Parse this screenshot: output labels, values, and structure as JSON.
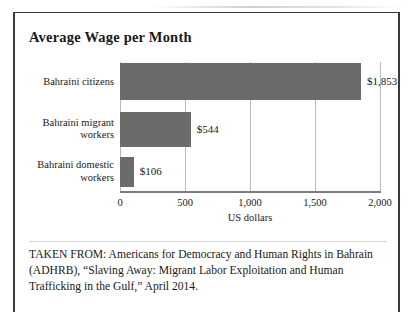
{
  "figure": {
    "title": "Average Wage per Month",
    "caption": "TAKEN FROM: Americans for Democracy and Human Rights in Bahrain (ADHRB), “Slaving Away: Migrant Labor Exploitation and Human Trafficking in the Gulf,” April 2014."
  },
  "chart_data": {
    "type": "bar",
    "orientation": "horizontal",
    "title": "Average Wage per Month",
    "categories": [
      "Bahraini citizens",
      "Bahraini migrant workers",
      "Bahraini domestic workers"
    ],
    "values": [
      1853,
      544,
      106
    ],
    "value_labels": [
      "$1,853",
      "$544",
      "$106"
    ],
    "xlabel": "US dollars",
    "ylabel": "",
    "xlim": [
      0,
      2000
    ],
    "xticks": [
      0,
      500,
      1000,
      1500,
      2000
    ],
    "xtick_labels": [
      "0",
      "500",
      "1,000",
      "1,500",
      "2,000"
    ],
    "grid": true,
    "legend": false,
    "bar_color": "#6b6b6b",
    "gridline_color": "#b9b9b9",
    "axis_color": "#7a7a7a"
  }
}
